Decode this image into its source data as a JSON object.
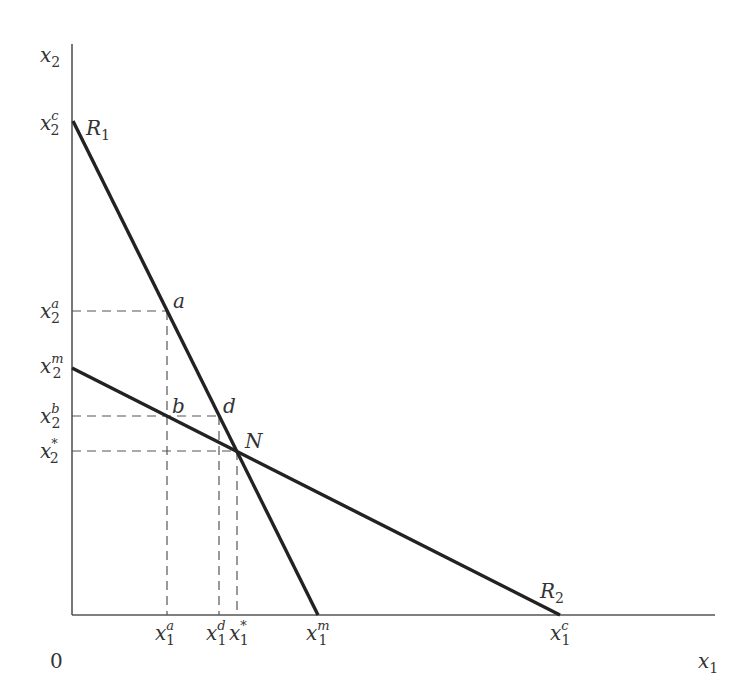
{
  "diagram": {
    "axes": {
      "x_label": {
        "base": "x",
        "sub": "1"
      },
      "y_label": {
        "base": "x",
        "sub": "2"
      },
      "origin": "0"
    },
    "curves": [
      {
        "name": "R1",
        "label": {
          "base": "R",
          "sub": "1"
        }
      },
      {
        "name": "R2",
        "label": {
          "base": "R",
          "sub": "2"
        }
      }
    ],
    "points": {
      "a": "a",
      "b": "b",
      "d": "d",
      "N": "N"
    },
    "y_ticks": [
      {
        "sup": "c",
        "sub": "2",
        "base": "x"
      },
      {
        "sup": "a",
        "sub": "2",
        "base": "x"
      },
      {
        "sup": "m",
        "sub": "2",
        "base": "x"
      },
      {
        "sup": "b",
        "sub": "2",
        "base": "x"
      },
      {
        "sup": "*",
        "sub": "2",
        "base": "x"
      }
    ],
    "x_ticks": [
      {
        "sup": "a",
        "sub": "1",
        "base": "x"
      },
      {
        "sup": "d",
        "sub": "1",
        "base": "x"
      },
      {
        "sup": "*",
        "sub": "1",
        "base": "x"
      },
      {
        "sup": "m",
        "sub": "1",
        "base": "x"
      },
      {
        "sup": "c",
        "sub": "1",
        "base": "x"
      }
    ],
    "colors": {
      "curve": "#222222",
      "axis": "#555555",
      "dash": "#555555"
    }
  }
}
